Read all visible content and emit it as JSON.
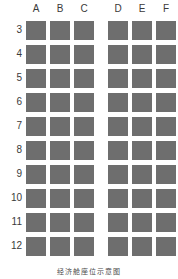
{
  "chart_data": {
    "type": "table",
    "title": "",
    "columns": [
      "A",
      "B",
      "C",
      "D",
      "E",
      "F"
    ],
    "rows": [
      "3",
      "4",
      "5",
      "6",
      "7",
      "8",
      "9",
      "10",
      "11",
      "12"
    ],
    "aisle_after_column": "C",
    "seat_fill_color": "#6e6e6e",
    "background_color": "#ffffff",
    "label_color": "#3a3a3a",
    "cells": [
      {
        "row": "3",
        "seats": [
          "A",
          "B",
          "C",
          "D",
          "E",
          "F"
        ]
      },
      {
        "row": "4",
        "seats": [
          "A",
          "B",
          "C",
          "D",
          "E",
          "F"
        ]
      },
      {
        "row": "5",
        "seats": [
          "A",
          "B",
          "C",
          "D",
          "E",
          "F"
        ]
      },
      {
        "row": "6",
        "seats": [
          "A",
          "B",
          "C",
          "D",
          "E",
          "F"
        ]
      },
      {
        "row": "7",
        "seats": [
          "A",
          "B",
          "C",
          "D",
          "E",
          "F"
        ]
      },
      {
        "row": "8",
        "seats": [
          "A",
          "B",
          "C",
          "D",
          "E",
          "F"
        ]
      },
      {
        "row": "9",
        "seats": [
          "A",
          "B",
          "C",
          "D",
          "E",
          "F"
        ]
      },
      {
        "row": "10",
        "seats": [
          "A",
          "B",
          "C",
          "D",
          "E",
          "F"
        ]
      },
      {
        "row": "11",
        "seats": [
          "A",
          "B",
          "C",
          "D",
          "E",
          "F"
        ]
      },
      {
        "row": "12",
        "seats": [
          "A",
          "B",
          "C",
          "D",
          "E",
          "F"
        ]
      }
    ]
  },
  "headers": {
    "col_a": "A",
    "col_b": "B",
    "col_c": "C",
    "col_d": "D",
    "col_e": "E",
    "col_f": "F"
  },
  "row_labels": {
    "r3": "3",
    "r4": "4",
    "r5": "5",
    "r6": "6",
    "r7": "7",
    "r8": "8",
    "r9": "9",
    "r10": "10",
    "r11": "11",
    "r12": "12"
  },
  "caption": {
    "text": "经济舱座位示意图"
  }
}
